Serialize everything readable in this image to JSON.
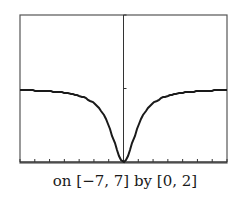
{
  "chart_data": {
    "type": "line",
    "title": "",
    "caption": "on [−7, 7] by [0, 2]",
    "xlabel": "",
    "ylabel": "",
    "xlim": [
      -7,
      7
    ],
    "ylim": [
      0,
      2
    ],
    "x_tick_step": 1,
    "y_tick_step": 1,
    "grid": false,
    "legend": null,
    "function": "y = x^2 / (1 + x^2)",
    "series": [
      {
        "name": "curve",
        "x": [
          -7,
          -6,
          -5,
          -4,
          -3,
          -2,
          -1.5,
          -1,
          -0.5,
          0,
          0.5,
          1,
          1.5,
          2,
          3,
          4,
          5,
          6,
          7
        ],
        "values": [
          0.98,
          0.973,
          0.962,
          0.941,
          0.9,
          0.8,
          0.692,
          0.5,
          0.2,
          0,
          0.2,
          0.5,
          0.692,
          0.8,
          0.9,
          0.941,
          0.962,
          0.973,
          0.98
        ]
      }
    ],
    "colors": {
      "frame": "#555555",
      "curve": "#1a1a1a",
      "axis": "#333333"
    }
  }
}
